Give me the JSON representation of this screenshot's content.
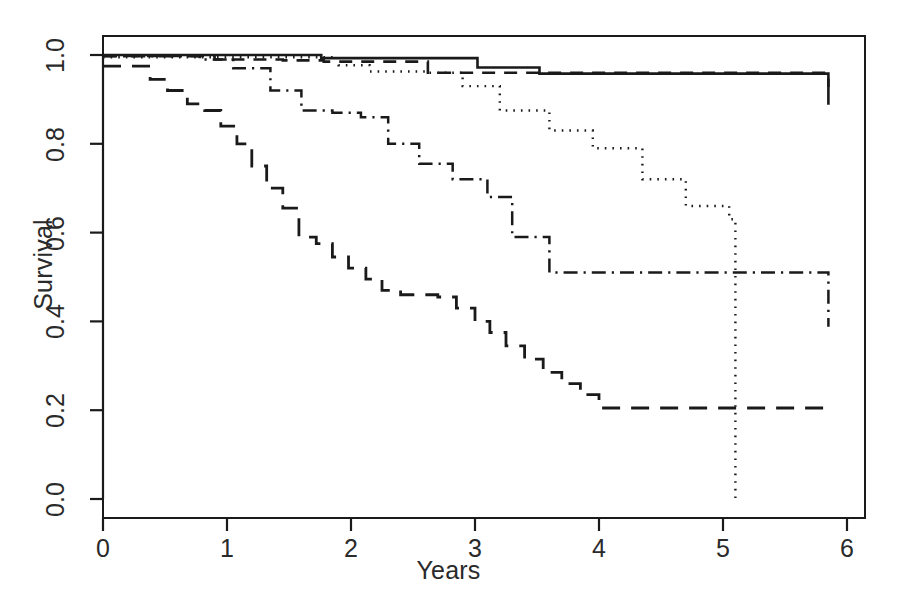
{
  "chart_data": {
    "type": "line",
    "title": "",
    "xlabel": "Years",
    "ylabel": "Survival",
    "xlim": [
      0,
      6
    ],
    "ylim": [
      0.0,
      1.0
    ],
    "xticks": [
      "0",
      "1",
      "2",
      "3",
      "4",
      "5",
      "6"
    ],
    "xtick_values": [
      0,
      1,
      2,
      3,
      4,
      5,
      6
    ],
    "yticks": [
      "0.0",
      "0.2",
      "0.4",
      "0.6",
      "0.8",
      "1.0"
    ],
    "ytick_values": [
      0.0,
      0.2,
      0.4,
      0.6,
      0.8,
      1.0
    ],
    "grid": false,
    "legend": "none",
    "step_type": "post",
    "line_color": "#1a1a1a",
    "series": [
      {
        "name": "group-1-solid",
        "linestyle": "solid",
        "x": [
          0.0,
          0.98,
          1.76,
          2.62,
          3.02,
          3.52,
          5.85
        ],
        "y": [
          1.0,
          1.0,
          0.993,
          0.993,
          0.972,
          0.958,
          0.888
        ]
      },
      {
        "name": "group-2-dashed",
        "linestyle": "dashed",
        "x": [
          0.0,
          0.3,
          0.9,
          1.2,
          1.45,
          1.78,
          2.62,
          5.85
        ],
        "y": [
          0.998,
          0.998,
          0.99,
          0.99,
          0.988,
          0.985,
          0.96,
          0.928
        ]
      },
      {
        "name": "group-3-dotted",
        "linestyle": "dotted",
        "x": [
          0.0,
          1.55,
          1.9,
          2.15,
          2.62,
          2.9,
          3.2,
          3.6,
          3.95,
          4.35,
          4.7,
          5.05,
          5.1,
          5.1
        ],
        "y": [
          0.995,
          0.995,
          0.977,
          0.963,
          0.96,
          0.93,
          0.875,
          0.83,
          0.79,
          0.72,
          0.66,
          0.63,
          0.57,
          0.0
        ]
      },
      {
        "name": "group-4-dashdot",
        "linestyle": "dashdot",
        "x": [
          0.0,
          0.5,
          0.78,
          1.05,
          1.35,
          1.6,
          1.85,
          2.08,
          2.3,
          2.55,
          2.82,
          3.1,
          3.3,
          3.6,
          4.67,
          5.85
        ],
        "y": [
          0.997,
          0.997,
          0.99,
          0.97,
          0.92,
          0.875,
          0.87,
          0.86,
          0.8,
          0.755,
          0.72,
          0.68,
          0.59,
          0.51,
          0.51,
          0.388
        ]
      },
      {
        "name": "group-5-longdash",
        "linestyle": "longdash",
        "x": [
          0.0,
          0.22,
          0.38,
          0.52,
          0.68,
          0.82,
          0.95,
          1.08,
          1.2,
          1.32,
          1.45,
          1.58,
          1.72,
          1.85,
          1.98,
          2.12,
          2.25,
          2.4,
          2.55,
          2.7,
          2.85,
          3.0,
          3.12,
          3.25,
          3.4,
          3.55,
          3.7,
          3.85,
          4.0,
          5.85
        ],
        "y": [
          0.975,
          0.975,
          0.945,
          0.92,
          0.89,
          0.875,
          0.84,
          0.8,
          0.75,
          0.7,
          0.655,
          0.59,
          0.575,
          0.545,
          0.52,
          0.495,
          0.47,
          0.46,
          0.46,
          0.455,
          0.43,
          0.4,
          0.375,
          0.345,
          0.315,
          0.285,
          0.26,
          0.235,
          0.205,
          0.205
        ]
      }
    ]
  },
  "geometry": {
    "plot_left": 103,
    "plot_right": 865,
    "plot_top": 36,
    "plot_bottom": 518,
    "x0_px": 103,
    "x_per_unit": 124,
    "y1_px": 55,
    "y0_px": 499
  }
}
